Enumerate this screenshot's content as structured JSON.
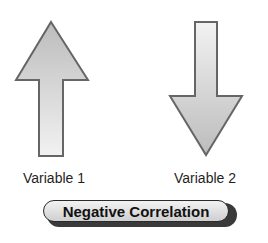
{
  "diagram": {
    "arrows": [
      {
        "id": "variable-1",
        "direction": "up",
        "label": "Variable 1"
      },
      {
        "id": "variable-2",
        "direction": "down",
        "label": "Variable 2"
      }
    ],
    "badge": {
      "label": "Negative Correlation"
    },
    "colors": {
      "arrow_fill_light": "#f0f0f0",
      "arrow_fill_dark": "#bdbdbd",
      "arrow_stroke": "#666666",
      "badge_shadow": "#3a3a3a",
      "text": "#1f1f1f"
    }
  }
}
